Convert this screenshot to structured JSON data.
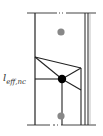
{
  "diagram": {
    "label": {
      "main": "l",
      "subscript": "eff,nc"
    },
    "colors": {
      "line": "#222222",
      "node_gray": "#888888",
      "node_black": "#000000"
    }
  }
}
